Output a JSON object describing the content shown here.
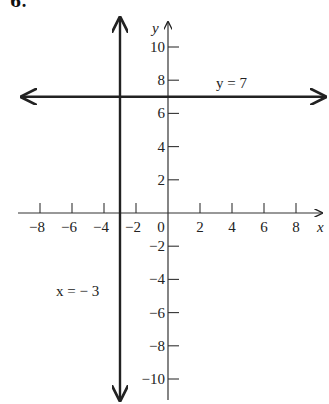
{
  "problem_number": "6.",
  "chart_data": {
    "type": "line",
    "title": "",
    "xlabel": "x",
    "ylabel": "y",
    "xlim": [
      -9,
      9
    ],
    "ylim": [
      -11,
      11
    ],
    "x_ticks": [
      -8,
      -6,
      -4,
      -2,
      0,
      2,
      4,
      6,
      8
    ],
    "y_ticks": [
      10,
      8,
      6,
      4,
      2,
      -2,
      -4,
      -6,
      -8,
      -10
    ],
    "x_tick_labels": [
      "−8",
      "−6",
      "−4",
      "−2",
      "0",
      "2",
      "4",
      "6",
      "8"
    ],
    "y_tick_labels": [
      "10",
      "8",
      "6",
      "4",
      "2",
      "−2",
      "−4",
      "−6",
      "−8",
      "−10"
    ],
    "grid": false,
    "series": [
      {
        "name": "y = 7",
        "kind": "horizontal",
        "value": 7,
        "label": "y = 7",
        "arrows": "both"
      },
      {
        "name": "x = −3",
        "kind": "vertical",
        "value": -3,
        "label": "x = − 3",
        "arrows": "both"
      }
    ],
    "annotations": [
      {
        "text": "y = 7",
        "near": [
          4.5,
          7.6
        ]
      },
      {
        "text": "x = − 3",
        "near": [
          -6.5,
          -3.8
        ]
      }
    ]
  },
  "labels": {
    "x_axis": "x",
    "y_axis": "y",
    "line_h": "y = 7",
    "line_v": "x = − 3"
  }
}
